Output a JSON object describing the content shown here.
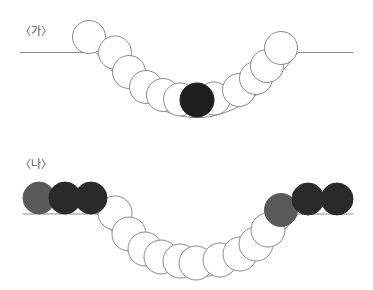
{
  "panels": [
    {
      "label": "〈가〉",
      "label_pos": {
        "x": 20,
        "y": 26
      },
      "ground": {
        "left": [
          20,
          96
        ],
        "right": [
          298,
          353
        ],
        "y": 52.5
      },
      "bowl": {
        "start": [
          96,
          52.5
        ],
        "control": [
          197,
          183
        ],
        "end": [
          298,
          52.5
        ]
      },
      "balls": [
        {
          "cx": 89,
          "cy": 37,
          "r": 16.5,
          "kind": "white"
        },
        {
          "cx": 115,
          "cy": 52.5,
          "r": 16.5,
          "kind": "white"
        },
        {
          "cx": 129,
          "cy": 72,
          "r": 16.5,
          "kind": "white"
        },
        {
          "cx": 146,
          "cy": 87,
          "r": 16.5,
          "kind": "white"
        },
        {
          "cx": 163,
          "cy": 95,
          "r": 16.5,
          "kind": "white"
        },
        {
          "cx": 180,
          "cy": 99.5,
          "r": 16.5,
          "kind": "white"
        },
        {
          "cx": 214,
          "cy": 98.5,
          "r": 16.5,
          "kind": "white"
        },
        {
          "cx": 239,
          "cy": 90,
          "r": 16.5,
          "kind": "white"
        },
        {
          "cx": 256,
          "cy": 78,
          "r": 16.5,
          "kind": "white"
        },
        {
          "cx": 267,
          "cy": 66,
          "r": 16.5,
          "kind": "white"
        },
        {
          "cx": 281,
          "cy": 48,
          "r": 16.5,
          "kind": "white"
        },
        {
          "cx": 197,
          "cy": 100,
          "r": 17,
          "kind": "black"
        }
      ]
    },
    {
      "label": "〈나〉",
      "label_pos": {
        "x": 20,
        "y": 159
      },
      "ground": {
        "left": [
          23,
          97
        ],
        "right": [
          298,
          353
        ],
        "y": 214
      },
      "bowl": {
        "start": [
          97,
          214
        ],
        "control": [
          197,
          340
        ],
        "end": [
          298,
          214
        ]
      },
      "balls": [
        {
          "cx": 115,
          "cy": 213,
          "r": 17,
          "kind": "white"
        },
        {
          "cx": 129,
          "cy": 234,
          "r": 17,
          "kind": "white"
        },
        {
          "cx": 145,
          "cy": 249,
          "r": 17,
          "kind": "white"
        },
        {
          "cx": 161,
          "cy": 257,
          "r": 17,
          "kind": "white"
        },
        {
          "cx": 180,
          "cy": 261,
          "r": 17,
          "kind": "white"
        },
        {
          "cx": 196,
          "cy": 263,
          "r": 17,
          "kind": "white"
        },
        {
          "cx": 220,
          "cy": 260,
          "r": 17,
          "kind": "white"
        },
        {
          "cx": 240,
          "cy": 254,
          "r": 17,
          "kind": "white"
        },
        {
          "cx": 256,
          "cy": 244,
          "r": 17,
          "kind": "white"
        },
        {
          "cx": 268,
          "cy": 230,
          "r": 17,
          "kind": "white"
        },
        {
          "cx": 39,
          "cy": 198,
          "r": 16,
          "kind": "gray"
        },
        {
          "cx": 65,
          "cy": 198,
          "r": 16,
          "kind": "dark"
        },
        {
          "cx": 91,
          "cy": 198,
          "r": 16,
          "kind": "dark"
        },
        {
          "cx": 281,
          "cy": 210,
          "r": 16.5,
          "kind": "gray"
        },
        {
          "cx": 308,
          "cy": 199,
          "r": 16,
          "kind": "dark"
        },
        {
          "cx": 337,
          "cy": 199,
          "r": 16,
          "kind": "dark"
        }
      ]
    }
  ],
  "colors": {
    "white": {
      "fill": "#ffffff",
      "stroke": "#8a8a8a"
    },
    "black": {
      "fill": "#1e1e1e",
      "stroke": "#1e1e1e"
    },
    "dark": {
      "fill": "#2a2a2a",
      "stroke": "#2a2a2a"
    },
    "gray": {
      "fill": "#5a5a5a",
      "stroke": "#5a5a5a"
    },
    "line": "#8a8a8a",
    "label": "#555555"
  }
}
